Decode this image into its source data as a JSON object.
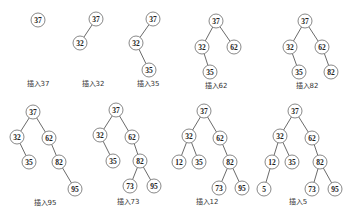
{
  "diagram": {
    "type": "binary-search-tree-insertion-sequence",
    "node_radius": 7,
    "trees": [
      {
        "caption": "插入37",
        "caption_pos": [
          38,
          86
        ],
        "nodes": [
          {
            "id": "37",
            "label": "37",
            "x": 38,
            "y": 20
          }
        ],
        "edges": []
      },
      {
        "caption": "插入32",
        "caption_pos": [
          93,
          86
        ],
        "nodes": [
          {
            "id": "37",
            "label": "37",
            "x": 96,
            "y": 19
          },
          {
            "id": "32",
            "label": "32",
            "x": 80,
            "y": 43
          }
        ],
        "edges": [
          [
            "37",
            "32"
          ]
        ]
      },
      {
        "caption": "插入35",
        "caption_pos": [
          148,
          86
        ],
        "nodes": [
          {
            "id": "37",
            "label": "37",
            "x": 153,
            "y": 19
          },
          {
            "id": "32",
            "label": "32",
            "x": 136,
            "y": 43
          },
          {
            "id": "35",
            "label": "35",
            "x": 149,
            "y": 70
          }
        ],
        "edges": [
          [
            "37",
            "32"
          ],
          [
            "32",
            "35"
          ]
        ]
      },
      {
        "caption": "插入62",
        "caption_pos": [
          216,
          88
        ],
        "nodes": [
          {
            "id": "37",
            "label": "37",
            "x": 216,
            "y": 21
          },
          {
            "id": "32",
            "label": "32",
            "x": 202,
            "y": 47
          },
          {
            "id": "62",
            "label": "62",
            "x": 234,
            "y": 47
          },
          {
            "id": "35",
            "label": "35",
            "x": 210,
            "y": 72
          }
        ],
        "edges": [
          [
            "37",
            "32"
          ],
          [
            "37",
            "62"
          ],
          [
            "32",
            "35"
          ]
        ]
      },
      {
        "caption": "插入82",
        "caption_pos": [
          307,
          88
        ],
        "nodes": [
          {
            "id": "37",
            "label": "37",
            "x": 305,
            "y": 21
          },
          {
            "id": "32",
            "label": "32",
            "x": 290,
            "y": 47
          },
          {
            "id": "62",
            "label": "62",
            "x": 322,
            "y": 47
          },
          {
            "id": "35",
            "label": "35",
            "x": 299,
            "y": 72
          },
          {
            "id": "82",
            "label": "82",
            "x": 331,
            "y": 72
          }
        ],
        "edges": [
          [
            "37",
            "32"
          ],
          [
            "37",
            "62"
          ],
          [
            "32",
            "35"
          ],
          [
            "62",
            "82"
          ]
        ]
      },
      {
        "caption": "插入95",
        "caption_pos": [
          45,
          205
        ],
        "nodes": [
          {
            "id": "37",
            "label": "37",
            "x": 33,
            "y": 112
          },
          {
            "id": "32",
            "label": "32",
            "x": 17,
            "y": 137
          },
          {
            "id": "62",
            "label": "62",
            "x": 49,
            "y": 138
          },
          {
            "id": "35",
            "label": "35",
            "x": 29,
            "y": 162
          },
          {
            "id": "82",
            "label": "82",
            "x": 59,
            "y": 162
          },
          {
            "id": "95",
            "label": "95",
            "x": 75,
            "y": 189
          }
        ],
        "edges": [
          [
            "37",
            "32"
          ],
          [
            "37",
            "62"
          ],
          [
            "32",
            "35"
          ],
          [
            "62",
            "82"
          ],
          [
            "82",
            "95"
          ]
        ]
      },
      {
        "caption": "插入73",
        "caption_pos": [
          128,
          204
        ],
        "nodes": [
          {
            "id": "37",
            "label": "37",
            "x": 116,
            "y": 110
          },
          {
            "id": "32",
            "label": "32",
            "x": 100,
            "y": 135
          },
          {
            "id": "62",
            "label": "62",
            "x": 132,
            "y": 137
          },
          {
            "id": "35",
            "label": "35",
            "x": 113,
            "y": 161
          },
          {
            "id": "82",
            "label": "82",
            "x": 140,
            "y": 161
          },
          {
            "id": "73",
            "label": "73",
            "x": 130,
            "y": 186
          },
          {
            "id": "95",
            "label": "95",
            "x": 154,
            "y": 186
          }
        ],
        "edges": [
          [
            "37",
            "32"
          ],
          [
            "37",
            "62"
          ],
          [
            "32",
            "35"
          ],
          [
            "62",
            "82"
          ],
          [
            "82",
            "73"
          ],
          [
            "82",
            "95"
          ]
        ]
      },
      {
        "caption": "插入12",
        "caption_pos": [
          207,
          204
        ],
        "nodes": [
          {
            "id": "37",
            "label": "37",
            "x": 204,
            "y": 111
          },
          {
            "id": "32",
            "label": "32",
            "x": 189,
            "y": 136
          },
          {
            "id": "62",
            "label": "62",
            "x": 220,
            "y": 138
          },
          {
            "id": "12",
            "label": "12",
            "x": 179,
            "y": 162
          },
          {
            "id": "35",
            "label": "35",
            "x": 199,
            "y": 162
          },
          {
            "id": "82",
            "label": "82",
            "x": 230,
            "y": 162
          },
          {
            "id": "73",
            "label": "73",
            "x": 219,
            "y": 188
          },
          {
            "id": "95",
            "label": "95",
            "x": 242,
            "y": 188
          }
        ],
        "edges": [
          [
            "37",
            "32"
          ],
          [
            "37",
            "62"
          ],
          [
            "32",
            "12"
          ],
          [
            "32",
            "35"
          ],
          [
            "62",
            "82"
          ],
          [
            "82",
            "73"
          ],
          [
            "82",
            "95"
          ]
        ]
      },
      {
        "caption": "插入5",
        "caption_pos": [
          298,
          204
        ],
        "nodes": [
          {
            "id": "37",
            "label": "37",
            "x": 295,
            "y": 111
          },
          {
            "id": "32",
            "label": "32",
            "x": 280,
            "y": 136
          },
          {
            "id": "62",
            "label": "62",
            "x": 312,
            "y": 138
          },
          {
            "id": "12",
            "label": "12",
            "x": 272,
            "y": 162
          },
          {
            "id": "35",
            "label": "35",
            "x": 292,
            "y": 162
          },
          {
            "id": "82",
            "label": "82",
            "x": 320,
            "y": 162
          },
          {
            "id": "5",
            "label": "5",
            "x": 264,
            "y": 189
          },
          {
            "id": "73",
            "label": "73",
            "x": 312,
            "y": 189
          },
          {
            "id": "95",
            "label": "95",
            "x": 335,
            "y": 189
          }
        ],
        "edges": [
          [
            "37",
            "32"
          ],
          [
            "37",
            "62"
          ],
          [
            "32",
            "12"
          ],
          [
            "32",
            "35"
          ],
          [
            "62",
            "82"
          ],
          [
            "12",
            "5"
          ],
          [
            "82",
            "73"
          ],
          [
            "82",
            "95"
          ]
        ]
      }
    ]
  }
}
